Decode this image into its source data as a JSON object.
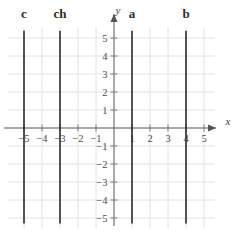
{
  "figure": {
    "title": "",
    "width": 245,
    "height": 244,
    "background": "#ffffff"
  },
  "axes": {
    "x_axis_label": "x",
    "y_axis_label": "y",
    "x_ticks": [
      "−5",
      "−4",
      "−3",
      "−2",
      "−1",
      "1",
      "2",
      "3",
      "4",
      "5"
    ],
    "y_ticks": [
      "5",
      "4",
      "3",
      "2",
      "1",
      "−1",
      "−2",
      "−3",
      "−4",
      "−5"
    ],
    "axis_color": "#555555",
    "grid_color": "#e2e2e2",
    "tick_color": "#7a7a7a",
    "label_color": "#4a4a4a"
  },
  "lines": [
    {
      "label": "c",
      "x": -5,
      "color": "#2b2b2b"
    },
    {
      "label": "ch",
      "x": -3,
      "color": "#2b2b2b"
    },
    {
      "label": "a",
      "x": 1,
      "color": "#2b2b2b"
    },
    {
      "label": "b",
      "x": 4,
      "color": "#2b2b2b"
    }
  ],
  "chart_data": {
    "type": "line",
    "title": "",
    "xlabel": "x",
    "ylabel": "y",
    "xlim": [
      -5.6,
      5.8
    ],
    "ylim": [
      -5.6,
      5.7
    ],
    "grid": true,
    "legend": "none",
    "xticks": [
      -5,
      -4,
      -3,
      -2,
      -1,
      1,
      2,
      3,
      4,
      5
    ],
    "yticks": [
      5,
      4,
      3,
      2,
      1,
      -1,
      -2,
      -3,
      -4,
      -5
    ],
    "series": [
      {
        "name": "c",
        "equation": "x = -5",
        "x": [
          -5,
          -5
        ],
        "y": [
          -5.3,
          5.4
        ]
      },
      {
        "name": "ch",
        "equation": "x = -3",
        "x": [
          -3,
          -3
        ],
        "y": [
          -5.3,
          5.4
        ]
      },
      {
        "name": "a",
        "equation": "x = 1",
        "x": [
          1,
          1
        ],
        "y": [
          -5.3,
          5.4
        ]
      },
      {
        "name": "b",
        "equation": "x = 4",
        "x": [
          4,
          4
        ],
        "y": [
          -5.3,
          5.4
        ]
      }
    ],
    "annotations": [
      {
        "text": "c",
        "x": -5,
        "y": 6.2
      },
      {
        "text": "ch",
        "x": -3,
        "y": 6.2
      },
      {
        "text": "a",
        "x": 1,
        "y": 6.2
      },
      {
        "text": "b",
        "x": 4,
        "y": 6.2
      }
    ]
  }
}
